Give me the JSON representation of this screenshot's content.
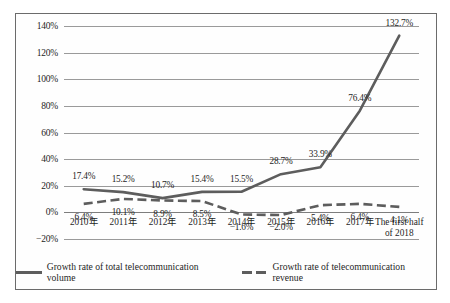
{
  "chart_data": {
    "type": "line",
    "title": "",
    "subtitle": "",
    "xlabel": "",
    "ylabel": "",
    "ylim": [
      -20,
      140
    ],
    "ytick_step": 20,
    "grid": true,
    "legend_position": "bottom",
    "categories": [
      "2010年",
      "2011年",
      "2012年",
      "2013年",
      "2014年",
      "2015年",
      "2016年",
      "2017年",
      "The first half of 2018"
    ],
    "ytick_labels": [
      "140%",
      "120%",
      "100%",
      "80%",
      "60%",
      "40%",
      "20%",
      "0%",
      "−20%"
    ],
    "ytick_values": [
      140,
      120,
      100,
      80,
      60,
      40,
      20,
      0,
      -20
    ],
    "series": [
      {
        "name": "Growth rate of total telecommunication volume",
        "style": "solid",
        "color": "#5d5d5d",
        "values": [
          17.4,
          15.2,
          10.7,
          15.4,
          15.5,
          28.7,
          33.9,
          76.4,
          132.7
        ],
        "labels": [
          "17.4%",
          "15.2%",
          "10.7%",
          "15.4%",
          "15.5%",
          "28.7%",
          "33.9%",
          "76.4%",
          "132.7%"
        ]
      },
      {
        "name": "Growth rate of telecommunication revenue",
        "style": "dashed",
        "color": "#5d5d5d",
        "values": [
          6.4,
          10.1,
          8.9,
          8.5,
          -1.6,
          -2.0,
          5.4,
          6.4,
          4.1
        ],
        "labels": [
          "6.4%",
          "10.1%",
          "8.9%",
          "8.5%",
          "−1.6%",
          "−2.0%",
          "5.4%",
          "6.4%",
          "4.1%"
        ]
      }
    ]
  },
  "legend": {
    "items": [
      {
        "label": "Growth rate of total telecommunication volume",
        "marker": "solid-line-icon"
      },
      {
        "label": "Growth rate of telecommunication revenue",
        "marker": "dashed-line-icon"
      }
    ]
  }
}
